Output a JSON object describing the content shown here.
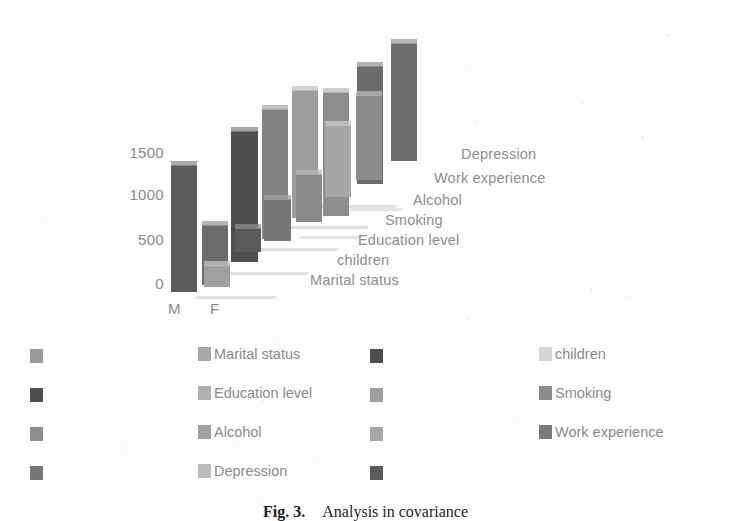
{
  "figure": {
    "caption_label": "Fig. 3.",
    "caption_text": "Analysis in covariance"
  },
  "chart_data": {
    "type": "bar",
    "render": "3d-bar",
    "title": "",
    "xlabel": "",
    "ylabel": "",
    "categories": [
      "M",
      "F"
    ],
    "ytick_labels": [
      "1500",
      "1000",
      "500",
      "0"
    ],
    "yticks": [
      1500,
      1000,
      500,
      0
    ],
    "ylim": [
      0,
      1750
    ],
    "grid": true,
    "legend_position": "bottom",
    "depth_axis_labels": [
      "Marital status",
      "children",
      "Education level",
      "Smoking",
      "Alcohol",
      "Work experience",
      "Depression"
    ],
    "series": [
      {
        "name": "Marital status",
        "color": "#4a4a4a",
        "values": [
          1230,
          1190
        ]
      },
      {
        "name": "children",
        "color": "#d0d0d0",
        "values": [
          95,
          60
        ]
      },
      {
        "name": "Education level",
        "color": "#5c5c5c",
        "values": [
          1400,
          430
        ]
      },
      {
        "name": "Smoking",
        "color": "#9a9a9a",
        "values": [
          120,
          95
        ]
      },
      {
        "name": "Alcohol",
        "color": "#6e6e6e",
        "values": [
          1180,
          640
        ]
      },
      {
        "name": "Work experience",
        "color": "#b4b4b4",
        "values": [
          1340,
          880
        ]
      },
      {
        "name": "Depression",
        "color": "#7e7e7e",
        "values": [
          1290,
          700
        ]
      }
    ]
  },
  "legend": {
    "rows": [
      {
        "left_swatch": "#9a9a9a",
        "mid": {
          "swatch": "#a8a8a8",
          "label": "Marital status"
        },
        "mid2_swatch": "#4d4d4d",
        "right": {
          "swatch": "#d6d6d6",
          "label": "children"
        }
      },
      {
        "left_swatch": "#4f4f4f",
        "mid": {
          "swatch": "#b0b0b0",
          "label": "Education level"
        },
        "mid2_swatch": "#9e9e9e",
        "right": {
          "swatch": "#8c8c8c",
          "label": "Smoking"
        }
      },
      {
        "left_swatch": "#8e8e8e",
        "mid": {
          "swatch": "#a2a2a2",
          "label": "Alcohol"
        },
        "mid2_swatch": "#a6a6a6",
        "right": {
          "swatch": "#7a7a7a",
          "label": "Work experience"
        }
      },
      {
        "left_swatch": "#777777",
        "mid": {
          "swatch": "#bcbcbc",
          "label": "Depression"
        },
        "mid2_swatch": "#5a5a5a",
        "right": {
          "swatch": "",
          "label": ""
        }
      }
    ]
  }
}
